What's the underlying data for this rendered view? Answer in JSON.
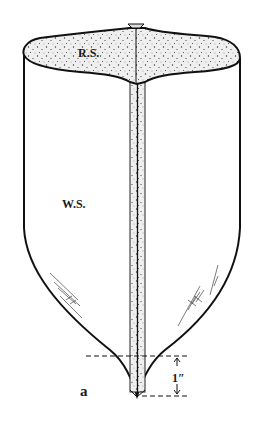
{
  "figure": {
    "labels": {
      "top_region": "R.S.",
      "body_region": "W.S.",
      "tip_label": "a",
      "dimension": "1″"
    },
    "colors": {
      "stroke": "#111111",
      "stipple_fill": "#ececec",
      "stipple_dots": "#333333",
      "background": "#ffffff"
    }
  }
}
